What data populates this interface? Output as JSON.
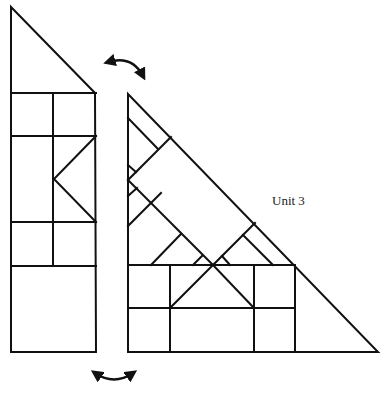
{
  "diagram": {
    "label": "Unit 3",
    "stroke_color": "#111111",
    "background": "#ffffff",
    "pieces": {
      "left": {
        "description": "tall strip with triangular top, grid of squares and a chevron",
        "outline": [
          [
            11,
            7
          ],
          [
            95,
            93
          ],
          [
            96,
            352
          ],
          [
            11,
            352
          ]
        ]
      },
      "right": {
        "description": "right triangle with diagonal strips and bottom grid",
        "outline": [
          [
            128,
            94
          ],
          [
            128,
            352
          ],
          [
            378,
            352
          ]
        ]
      }
    },
    "arrows": [
      {
        "name": "top-swap-arrow",
        "from": [
          105,
          60
        ],
        "to": [
          145,
          80
        ]
      },
      {
        "name": "bottom-swap-arrow",
        "from": [
          93,
          370
        ],
        "to": [
          135,
          370
        ]
      }
    ]
  }
}
